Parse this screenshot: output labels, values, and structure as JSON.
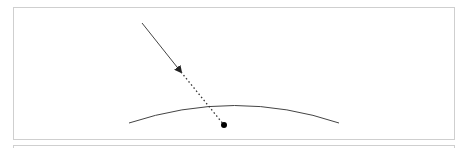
{
  "diagram": {
    "colors": {
      "border": "#cfcfcf",
      "line": "#444444",
      "point": "#000000"
    },
    "incoming_ray": {
      "x1": 142,
      "y1": 23,
      "x2": 181,
      "y2": 72
    },
    "extension_ray": {
      "x1": 181,
      "y1": 72,
      "x2": 224,
      "y2": 125
    },
    "surface_curve": {
      "start": [
        129,
        123
      ],
      "control": [
        235,
        88
      ],
      "end": [
        339,
        123
      ]
    },
    "point": {
      "cx": 224,
      "cy": 125,
      "r": 3
    }
  }
}
